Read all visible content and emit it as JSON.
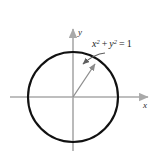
{
  "figure": {
    "kind": "unit-circle-diagram",
    "width": 156,
    "height": 157,
    "background_color": "#ffffff"
  },
  "axes": {
    "x_axis_label": "x",
    "y_axis_label": "y",
    "axis_color": "#a9a9a9",
    "origin": {
      "x": 73,
      "y": 97
    },
    "x_axis": {
      "start_x": 10,
      "end_x": 151,
      "y": 97
    },
    "y_axis": {
      "x": 73,
      "start_y": 26,
      "end_y": 151
    }
  },
  "circle": {
    "center_x": 73,
    "center_y": 97,
    "radius": 45,
    "stroke_color": "#111111",
    "stroke_width": 2.1,
    "fill": "none"
  },
  "radius_arrow": {
    "from_x": 73,
    "from_y": 97,
    "to_x": 97,
    "to_y": 62,
    "color": "#8c8c8c"
  },
  "leader_line": {
    "from_x": 105,
    "from_y": 53,
    "to_x": 79,
    "to_y": 65,
    "color": "#6e6e6e"
  },
  "equation": {
    "full_text": "x² + y² = 1",
    "x_term": "x",
    "x_exponent": "2",
    "plus_sign": "+",
    "y_term": "y",
    "y_exponent": "2",
    "equals_sign": "=",
    "right_hand_side": "1",
    "position_x": 92,
    "position_y": 47,
    "color": "#1a1a1a"
  }
}
